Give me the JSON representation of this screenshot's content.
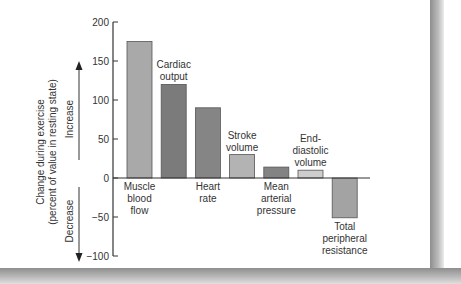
{
  "chart_data": {
    "type": "bar",
    "title": "",
    "xlabel": "",
    "ylabel": "Change during exercise (percent of value in resting state)",
    "ylabel_line1": "Change during exercise",
    "ylabel_line2": "(percent of value in resting state)",
    "direction_labels": {
      "increase": "Increase",
      "decrease": "Decrease"
    },
    "ylim": [
      -100,
      200
    ],
    "yticks": [
      200,
      150,
      100,
      50,
      0,
      -50,
      -100
    ],
    "ytick_labels": [
      "200",
      "150",
      "100",
      "50",
      "0",
      "−50",
      "−100"
    ],
    "grid": false,
    "legend": null,
    "categories": [
      "Muscle blood flow",
      "Cardiac output",
      "Heart rate",
      "Stroke volume",
      "Mean arterial pressure",
      "End-diastolic volume",
      "Total peripheral resistance"
    ],
    "category_label_lines": [
      [
        "Muscle",
        "blood",
        "flow"
      ],
      [
        "Cardiac",
        "output"
      ],
      [
        "Heart",
        "rate"
      ],
      [
        "Stroke",
        "volume"
      ],
      [
        "Mean",
        "arterial",
        "pressure"
      ],
      [
        "End-",
        "diastolic",
        "volume"
      ],
      [
        "Total",
        "peripheral",
        "resistance"
      ]
    ],
    "values": [
      175,
      120,
      90,
      30,
      14,
      10,
      -51
    ],
    "bar_colors": [
      "#a9a9a9",
      "#7b7b7b",
      "#858585",
      "#b3b3b3",
      "#838383",
      "#cdcdcd",
      "#a3a3a3"
    ]
  }
}
